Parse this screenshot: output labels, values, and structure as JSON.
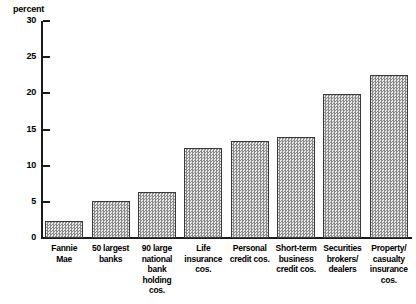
{
  "chart_data": {
    "type": "bar",
    "title": "",
    "subtitle": "",
    "xlabel": "",
    "ylabel": "percent",
    "unit_label": "percent",
    "ylim": [
      0,
      30
    ],
    "ytick_step": 5,
    "yticks": [
      0,
      5,
      10,
      15,
      20,
      25,
      30
    ],
    "ytick_labels": [
      "0",
      "5",
      "10",
      "15",
      "20",
      "25",
      "30"
    ],
    "grid": false,
    "legend": false,
    "legend_position": "none",
    "categories": [
      "Fannie Mae",
      "50 largest banks",
      "90 large national bank holding cos.",
      "Life insurance cos.",
      "Personal credit cos.",
      "Short-term business credit cos.",
      "Securities brokers/dealers",
      "Property/casualty insurance cos."
    ],
    "category_label_lines": [
      [
        "Fannie",
        "Mae"
      ],
      [
        "50 largest",
        "banks"
      ],
      [
        "90 large",
        "national bank",
        "holding cos."
      ],
      [
        "Life",
        "insurance",
        "cos."
      ],
      [
        "Personal",
        "credit cos."
      ],
      [
        "Short-term",
        "business",
        "credit cos."
      ],
      [
        "Securities",
        "brokers/",
        "dealers"
      ],
      [
        "Property/",
        "casualty",
        "insurance cos."
      ]
    ],
    "values": [
      2.4,
      5.1,
      6.3,
      12.4,
      13.4,
      13.9,
      19.9,
      22.6
    ],
    "bar_fill": "#c9c9c9",
    "bar_edge": "#3a3a3a",
    "axis_color": "#1a1a1a"
  }
}
